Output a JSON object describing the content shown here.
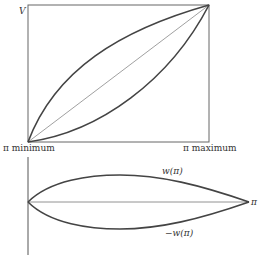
{
  "top_diagram": {
    "y_axis_label": "V",
    "x_min_label": "π minimum",
    "x_max_label": "π maximum",
    "curves": [
      "upper concave curve",
      "straight diagonal",
      "lower convex curve"
    ]
  },
  "bottom_diagram": {
    "upper_curve_label": "w(π)",
    "lower_curve_label": "−w(π)",
    "x_axis_label": "π"
  },
  "colors": {
    "line": "#444444",
    "thin_line": "#666666",
    "text": "#333333",
    "background": "#ffffff"
  }
}
